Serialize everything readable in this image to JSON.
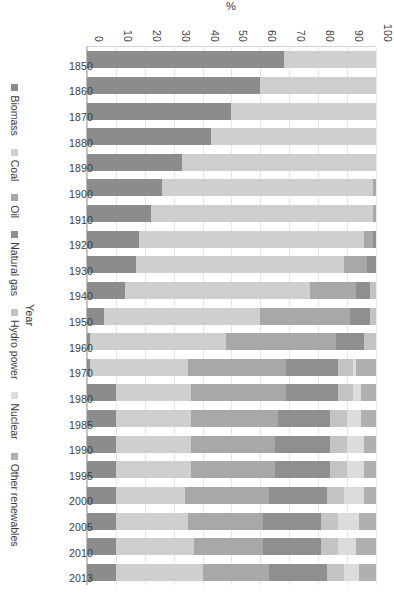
{
  "chart_data": {
    "type": "bar",
    "stacked": true,
    "orientation": "vertical-rotated-90",
    "title": "",
    "xlabel": "Year",
    "ylabel": "%",
    "ylim": [
      0,
      100
    ],
    "yticks": [
      0,
      10,
      20,
      30,
      40,
      50,
      60,
      70,
      80,
      90,
      100
    ],
    "ytick_labels": [
      "0",
      "10",
      "20",
      "30",
      "40",
      "50",
      "60",
      "70",
      "80",
      "90",
      "100"
    ],
    "grid": true,
    "legend_position": "bottom",
    "categories": [
      "1850",
      "1860",
      "1870",
      "1880",
      "1890",
      "1900",
      "1910",
      "1920",
      "1930",
      "1940",
      "1950",
      "1960",
      "1970",
      "1980",
      "1985",
      "1990",
      "1995",
      "2000",
      "2005",
      "2010",
      "2013"
    ],
    "series": [
      {
        "name": "Biomass",
        "color": "#8c8c8c",
        "values": [
          68,
          60,
          50,
          43,
          33,
          26,
          22,
          18,
          17,
          13,
          6,
          1,
          1,
          10,
          10,
          10,
          10,
          10,
          10,
          10,
          10
        ]
      },
      {
        "name": "Coal",
        "color": "#cfcfcf",
        "values": [
          32,
          40,
          50,
          57,
          67,
          73,
          77,
          78,
          72,
          64,
          54,
          47,
          34,
          26,
          26,
          26,
          26,
          24,
          25,
          27,
          30
        ]
      },
      {
        "name": "Oil",
        "color": "#a8a8a8",
        "values": [
          0,
          0,
          0,
          0,
          0,
          1,
          1,
          3,
          8,
          16,
          31,
          38,
          34,
          33,
          30,
          29,
          29,
          29,
          26,
          24,
          23
        ]
      },
      {
        "name": "Natural gas",
        "color": "#8f8f8f",
        "values": [
          0,
          0,
          0,
          0,
          0,
          0,
          0,
          1,
          3,
          5,
          7,
          10,
          18,
          18,
          18,
          19,
          19,
          20,
          20,
          20,
          20
        ]
      },
      {
        "name": "Hydro power",
        "color": "#c4c4c4",
        "values": [
          0,
          0,
          0,
          0,
          0,
          0,
          0,
          0,
          0,
          2,
          2,
          4,
          5,
          5,
          6,
          6,
          6,
          6,
          6,
          6,
          6
        ]
      },
      {
        "name": "Nuclear",
        "color": "#dcdcdc",
        "values": [
          0,
          0,
          0,
          0,
          0,
          0,
          0,
          0,
          0,
          0,
          0,
          0,
          1,
          3,
          5,
          6,
          6,
          7,
          7,
          6,
          5
        ]
      },
      {
        "name": "Other renewables",
        "color": "#b0b0b0",
        "values": [
          0,
          0,
          0,
          0,
          0,
          0,
          0,
          0,
          0,
          0,
          0,
          0,
          7,
          5,
          5,
          4,
          4,
          4,
          6,
          7,
          6
        ]
      }
    ]
  },
  "axis": {
    "y_title": "%",
    "x_title": "Year"
  },
  "legend": {
    "items": [
      {
        "label": "Biomass"
      },
      {
        "label": "Coal"
      },
      {
        "label": "Oil"
      },
      {
        "label": "Natural gas"
      },
      {
        "label": "Hydro power"
      },
      {
        "label": "Nuclear"
      },
      {
        "label": "Other renewables"
      }
    ]
  }
}
